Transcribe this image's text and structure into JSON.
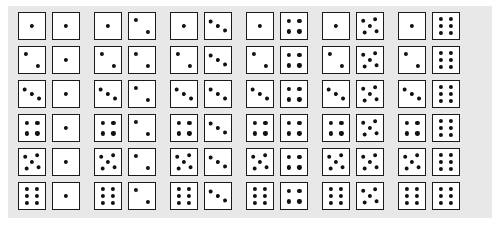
{
  "figure": {
    "name": "two-dice-sample-space",
    "rows": 6,
    "columns": 6,
    "total_outcomes": 36,
    "background_color": "#ffffff",
    "plate_color": "#e8e8e8",
    "die_face_color": "#ffffff",
    "die_border_color": "#1b1b1b",
    "pip_color": "#111111"
  },
  "chart_data": {
    "type": "table",
    "title": "",
    "xlabel": "",
    "ylabel": "",
    "categories": [
      "1",
      "2",
      "3",
      "4",
      "5",
      "6"
    ],
    "row_labels": [
      "1",
      "2",
      "3",
      "4",
      "5",
      "6"
    ],
    "column_labels": [
      "1",
      "2",
      "3",
      "4",
      "5",
      "6"
    ],
    "legend": [],
    "grid": false,
    "outcomes": [
      [
        [
          1,
          1
        ],
        [
          1,
          2
        ],
        [
          1,
          3
        ],
        [
          1,
          4
        ],
        [
          1,
          5
        ],
        [
          1,
          6
        ]
      ],
      [
        [
          2,
          1
        ],
        [
          2,
          2
        ],
        [
          2,
          3
        ],
        [
          2,
          4
        ],
        [
          2,
          5
        ],
        [
          2,
          6
        ]
      ],
      [
        [
          3,
          1
        ],
        [
          3,
          2
        ],
        [
          3,
          3
        ],
        [
          3,
          4
        ],
        [
          3,
          5
        ],
        [
          3,
          6
        ]
      ],
      [
        [
          4,
          1
        ],
        [
          4,
          2
        ],
        [
          4,
          3
        ],
        [
          4,
          4
        ],
        [
          4,
          5
        ],
        [
          4,
          6
        ]
      ],
      [
        [
          5,
          1
        ],
        [
          5,
          2
        ],
        [
          5,
          3
        ],
        [
          5,
          4
        ],
        [
          5,
          5
        ],
        [
          5,
          6
        ]
      ],
      [
        [
          6,
          1
        ],
        [
          6,
          2
        ],
        [
          6,
          3
        ],
        [
          6,
          4
        ],
        [
          6,
          5
        ],
        [
          6,
          6
        ]
      ]
    ]
  },
  "pip_layouts": {
    "1": [
      [
        50,
        50
      ]
    ],
    "2": [
      [
        28,
        28
      ],
      [
        72,
        72
      ]
    ],
    "3": [
      [
        26,
        26
      ],
      [
        50,
        50
      ],
      [
        74,
        74
      ]
    ],
    "4": [
      [
        29,
        29
      ],
      [
        71,
        29
      ],
      [
        29,
        71
      ],
      [
        71,
        71
      ]
    ],
    "5": [
      [
        28,
        28
      ],
      [
        72,
        28
      ],
      [
        50,
        50
      ],
      [
        28,
        72
      ],
      [
        72,
        72
      ]
    ],
    "6": [
      [
        30,
        24
      ],
      [
        70,
        24
      ],
      [
        30,
        50
      ],
      [
        70,
        50
      ],
      [
        30,
        76
      ],
      [
        70,
        76
      ]
    ]
  },
  "layout": {
    "die_size_px": 28,
    "die_gap_px": 6,
    "pair_gap_px": 14,
    "row_pitch_px": 34,
    "origin_x_px": 18,
    "origin_y_px": 12
  }
}
